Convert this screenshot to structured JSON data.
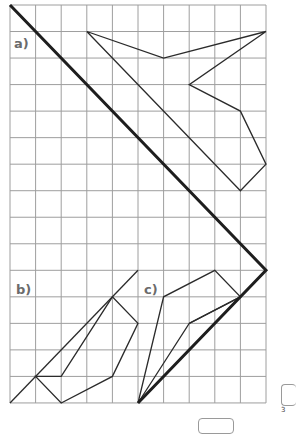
{
  "grid": {
    "cols": 10,
    "rows": 15,
    "origin_x": 10,
    "origin_y": 5,
    "cell_w": 25.6,
    "cell_h": 26.53,
    "line_color": "#9e9e9e",
    "shape_color": "#2b2b2b",
    "mirror_color": "#1e1e1e"
  },
  "mirror_line": {
    "points": [
      [
        0,
        0
      ],
      [
        10,
        10
      ],
      [
        5,
        15
      ]
    ]
  },
  "exercises": [
    {
      "label": "a)",
      "label_pos": [
        13,
        37
      ],
      "polygon": [
        [
          3,
          1
        ],
        [
          6,
          2
        ],
        [
          10,
          1
        ],
        [
          7,
          3
        ],
        [
          9,
          4
        ],
        [
          10,
          6
        ],
        [
          9,
          7
        ]
      ],
      "extra_lines": []
    },
    {
      "label": "b)",
      "label_pos": [
        15,
        283
      ],
      "polygon": [
        [
          1,
          14
        ],
        [
          2,
          14
        ],
        [
          4,
          11
        ],
        [
          5,
          12
        ],
        [
          4,
          14
        ],
        [
          2,
          15
        ]
      ],
      "extra_lines": [
        [
          [
            0,
            15
          ],
          [
            5,
            10
          ]
        ]
      ]
    },
    {
      "label": "c)",
      "label_pos": [
        143,
        283
      ],
      "polygon": [
        [
          5,
          15
        ],
        [
          6,
          11
        ],
        [
          8,
          10
        ],
        [
          9,
          11
        ],
        [
          7,
          12
        ]
      ],
      "extra_lines": [
        [
          [
            7,
            12
          ],
          [
            9,
            11
          ]
        ]
      ]
    }
  ],
  "footer": {
    "page_number": "3"
  }
}
